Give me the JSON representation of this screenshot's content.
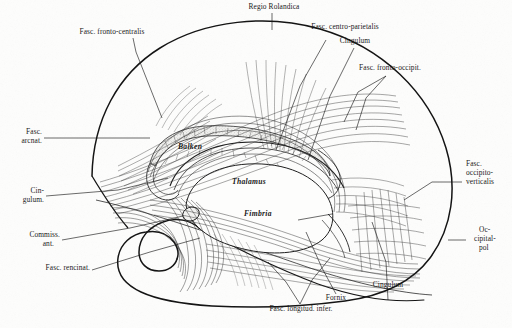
{
  "plate": {
    "kind": "anatomical-engraving",
    "subject": "sagittal dissection of cerebral white matter fiber tracts",
    "background_color": "#fdfdfc",
    "ink_color": "#1a1a1a"
  },
  "labels": {
    "fasc_fronto_centralis": "Fasc. fronto-centralis",
    "regio_rolandica": "Regio Rolandica",
    "fasc_centro_parietalis": "Fasc. centro-parietalis",
    "cingulum_top": "Cingulum",
    "fasc_fronto_occipit": "Fasc. fronto-occipit.",
    "fasc_arcuat_l1": "Fasc.",
    "fasc_arcuat_l2": "arcnat.",
    "cingulum_left_l1": "Cin-",
    "cingulum_left_l2": "gulum.",
    "commiss_ant_l1": "Commiss.",
    "commiss_ant_l2": "ant.",
    "fasc_uncinat": "Fasc. rencinat.",
    "fasc_occipito_vert_l1": "Fasc.",
    "fasc_occipito_vert_l2": "occipito-",
    "fasc_occipito_vert_l3": "verticalis",
    "occipitalpol_l1": "Oc-",
    "occipitalpol_l2": "cipital-",
    "occipitalpol_l3": "pol",
    "cingulum_bottom": "Cingulum",
    "fornix": "Fornix",
    "fasc_longitud_infer": "Fasc. longitud. infer.",
    "balken": "Balken",
    "thalamus": "Thalamus",
    "fimbria": "Fimbria"
  }
}
